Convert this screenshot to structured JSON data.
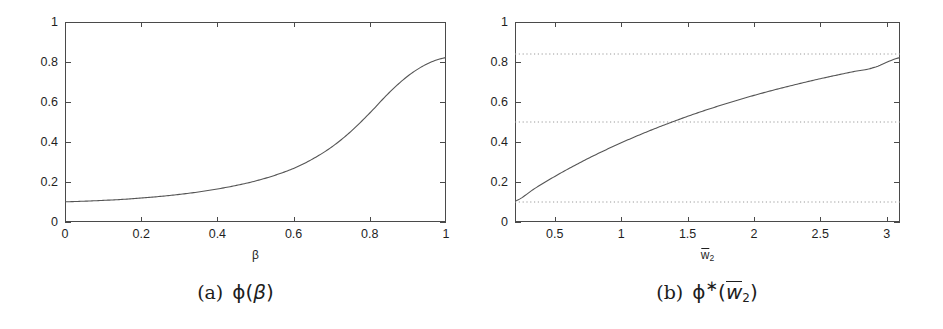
{
  "figure": {
    "background": "#ffffff",
    "axis_color": "#4a4a4a",
    "curve_color": "#555555",
    "grid_color": "#9a9a9a"
  },
  "panels": [
    {
      "id": "a",
      "caption_index": "(a)",
      "caption_body": "ϕ(β)",
      "x_axis_title": "β",
      "y_ticks": [
        "0",
        "0.2",
        "0.4",
        "0.6",
        "0.8",
        "1"
      ],
      "x_ticks": [
        "0",
        "0.2",
        "0.4",
        "0.6",
        "0.8",
        "1"
      ]
    },
    {
      "id": "b",
      "caption_index": "(b)",
      "caption_body": "ϕ*(w̄2)",
      "x_axis_title_base": "w",
      "x_axis_title_sub": "2",
      "y_ticks": [
        "0",
        "0.2",
        "0.4",
        "0.6",
        "0.8",
        "1"
      ],
      "x_ticks": [
        "0.5",
        "1",
        "1.5",
        "2",
        "2.5",
        "3"
      ]
    }
  ],
  "chart_data": [
    {
      "type": "line",
      "panel": "a",
      "title": "",
      "xlabel": "β",
      "ylabel": "",
      "xlim": [
        0,
        1
      ],
      "ylim": [
        0,
        1
      ],
      "xticks": [
        0,
        0.2,
        0.4,
        0.6,
        0.8,
        1
      ],
      "yticks": [
        0,
        0.2,
        0.4,
        0.6,
        0.8,
        1
      ],
      "grid": false,
      "legend": null,
      "series": [
        {
          "name": "ϕ(β)",
          "x": [
            0,
            0.05,
            0.1,
            0.15,
            0.2,
            0.25,
            0.3,
            0.35,
            0.4,
            0.45,
            0.5,
            0.55,
            0.6,
            0.65,
            0.7,
            0.75,
            0.8,
            0.85,
            0.9,
            0.95,
            1
          ],
          "y": [
            0.101,
            0.104,
            0.108,
            0.113,
            0.12,
            0.128,
            0.138,
            0.15,
            0.165,
            0.183,
            0.205,
            0.233,
            0.268,
            0.315,
            0.375,
            0.452,
            0.545,
            0.645,
            0.73,
            0.79,
            0.822
          ]
        }
      ]
    },
    {
      "type": "line",
      "panel": "b",
      "title": "",
      "xlabel": "w̄2",
      "ylabel": "",
      "xlim": [
        0.2,
        3.1
      ],
      "ylim": [
        0,
        1
      ],
      "xticks": [
        0.5,
        1,
        1.5,
        2,
        2.5,
        3
      ],
      "yticks": [
        0,
        0.2,
        0.4,
        0.6,
        0.8,
        1
      ],
      "grid": true,
      "gridlines_y": [
        0.1,
        0.5,
        0.84
      ],
      "legend": null,
      "series": [
        {
          "name": "ϕ*(w̄2)",
          "x": [
            0.2,
            0.35,
            0.5,
            0.65,
            0.8,
            0.95,
            1.1,
            1.25,
            1.4,
            1.55,
            1.7,
            1.85,
            2.0,
            2.15,
            2.3,
            2.45,
            2.6,
            2.75,
            2.9,
            3.1
          ],
          "y": [
            0.104,
            0.168,
            0.228,
            0.283,
            0.334,
            0.381,
            0.425,
            0.466,
            0.504,
            0.54,
            0.573,
            0.604,
            0.633,
            0.66,
            0.685,
            0.709,
            0.731,
            0.752,
            0.772,
            0.822
          ]
        }
      ]
    }
  ]
}
